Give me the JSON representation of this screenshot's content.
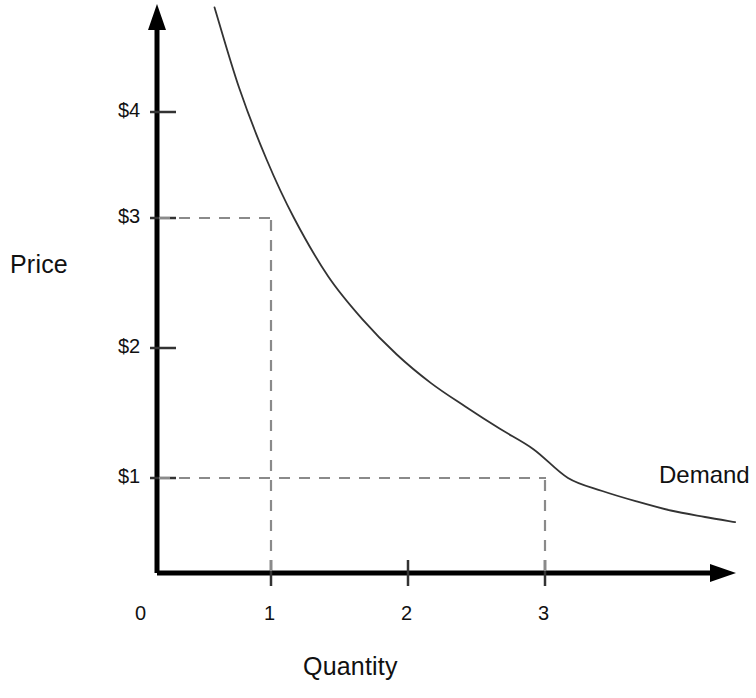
{
  "chart_data": {
    "type": "line",
    "title": "",
    "subtitle": "",
    "xlabel": "Quantity",
    "ylabel": "Price",
    "grid": false,
    "legend_position": "inline-right",
    "xlim": [
      0,
      4.35
    ],
    "ylim": [
      0,
      4.8
    ],
    "x_ticks": [
      {
        "value": 0,
        "label": "0"
      },
      {
        "value": 1,
        "label": "1"
      },
      {
        "value": 2,
        "label": "2"
      },
      {
        "value": 3,
        "label": "3"
      }
    ],
    "y_ticks": [
      {
        "value": 1,
        "label": "$1"
      },
      {
        "value": 2,
        "label": "$2"
      },
      {
        "value": 3,
        "label": "$3"
      },
      {
        "value": 4,
        "label": "$4"
      }
    ],
    "series": [
      {
        "name": "Demand",
        "label": "Demand",
        "color": "#333333",
        "points": [
          {
            "x": 0.42,
            "y": 4.62
          },
          {
            "x": 0.6,
            "y": 4.0
          },
          {
            "x": 0.8,
            "y": 3.45
          },
          {
            "x": 1.0,
            "y": 3.0
          },
          {
            "x": 1.25,
            "y": 2.55
          },
          {
            "x": 1.5,
            "y": 2.22
          },
          {
            "x": 1.75,
            "y": 1.95
          },
          {
            "x": 2.0,
            "y": 1.73
          },
          {
            "x": 2.25,
            "y": 1.55
          },
          {
            "x": 2.5,
            "y": 1.38
          },
          {
            "x": 2.75,
            "y": 1.22
          },
          {
            "x": 3.0,
            "y": 1.0
          },
          {
            "x": 3.25,
            "y": 0.9
          },
          {
            "x": 3.5,
            "y": 0.82
          },
          {
            "x": 3.75,
            "y": 0.75
          },
          {
            "x": 4.0,
            "y": 0.7
          },
          {
            "x": 4.22,
            "y": 0.66
          }
        ]
      }
    ],
    "annotations": [
      {
        "type": "guide-lines",
        "x": 1,
        "y": 3,
        "style": "dashed",
        "note": "Price $3 at quantity 1"
      },
      {
        "type": "guide-lines",
        "x": 3,
        "y": 1,
        "style": "dashed",
        "note": "Price $1 at quantity 3"
      }
    ]
  },
  "labels": {
    "price": "Price",
    "quantity": "Quantity",
    "demand": "Demand",
    "y4": "$4",
    "y3": "$3",
    "y2": "$2",
    "y1": "$1",
    "x0": "0",
    "x1": "1",
    "x2": "2",
    "x3": "3"
  },
  "colors": {
    "axis": "#000000",
    "curve": "#333333",
    "guide": "#888888",
    "text": "#111111",
    "background": "#ffffff"
  }
}
